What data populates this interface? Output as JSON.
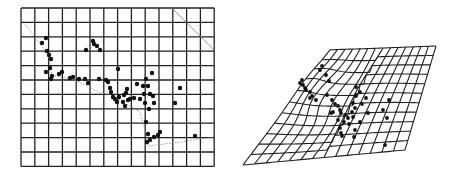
{
  "figure": {
    "panels": [
      {
        "id": "left",
        "description": "Regular reference grid with landmark points",
        "cols": 14,
        "rows": 11
      },
      {
        "id": "right",
        "description": "Deformed thin-plate spline grid with landmark points"
      }
    ]
  },
  "colors": {
    "grid": "#222222",
    "points": "#111111",
    "dotted": "#888888"
  }
}
